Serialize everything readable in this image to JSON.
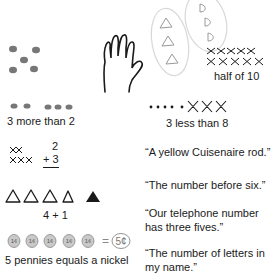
{
  "left_column": {
    "dots_five": {
      "icon": "five-dots-dice-pattern",
      "count": 5
    },
    "hand": {
      "icon": "hand-outline-five-fingers"
    },
    "more_than": {
      "caption": "3 more than 2",
      "left_dots": 2,
      "right_dots": 3
    },
    "addition": {
      "top": "2",
      "bottom": "+ 3",
      "x_rows": [
        2,
        3
      ]
    },
    "triangles": {
      "caption": "4 + 1",
      "outlined": 4,
      "filled": 1
    },
    "pennies": {
      "coin_label": "1¢",
      "count": 5,
      "equals": "=",
      "nickel_label": "5¢",
      "caption": "5 pennies equals a nickel"
    }
  },
  "right_column": {
    "groups": {
      "triangles_in_oval": 3,
      "d_shapes_in_oval": 3
    },
    "half": {
      "caption": "half of 10",
      "x_rows": [
        5,
        5
      ]
    },
    "less_than": {
      "caption": "3 less than 8",
      "dots": 5,
      "crossed": 3
    },
    "quotes": [
      "“A yellow Cuisenaire rod.”",
      "“The number before six.”",
      "“Our telephone number has three fives.”",
      "“The number of letters in my name.”"
    ]
  },
  "colors": {
    "ink": "#1a1a1a",
    "dot_gray": "#777777",
    "oval_gray": "#d8d8d8",
    "coin_fill": "#c9c9c9"
  }
}
